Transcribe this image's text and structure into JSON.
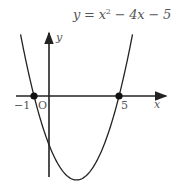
{
  "chart_data": {
    "type": "line",
    "equation": {
      "prefix": "y = x",
      "exp": "2",
      "suffix": " − 4x − 5"
    },
    "xlabel": "x",
    "ylabel": "y",
    "origin_label": "O",
    "tick_labels": {
      "neg_one": "−1",
      "five": "5"
    },
    "marked_points": [
      {
        "x": -1,
        "y": 0
      },
      {
        "x": 5,
        "y": 0
      }
    ],
    "vertex": {
      "x": 2,
      "y": -9
    },
    "y_intercept": -5,
    "xlim": [
      -2.5,
      9
    ],
    "ylim": [
      -9,
      7.5
    ],
    "grid": false,
    "curve_color": "#222222",
    "axis_color": "#222222",
    "text_color": "#555555"
  }
}
